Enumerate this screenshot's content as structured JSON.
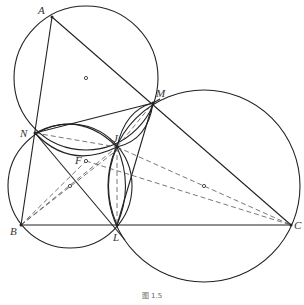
{
  "figure": {
    "caption": "图 1.5",
    "points": [
      {
        "name": "A",
        "x": 52,
        "y": 17,
        "lx": 38,
        "ly": 5
      },
      {
        "name": "M",
        "x": 153,
        "y": 103,
        "lx": 156,
        "ly": 88
      },
      {
        "name": "N",
        "x": 35,
        "y": 133,
        "lx": 20,
        "ly": 128
      },
      {
        "name": "J",
        "x": 117,
        "y": 147,
        "lx": 113,
        "ly": 133
      },
      {
        "name": "F",
        "x": 86,
        "y": 161,
        "lx": 75,
        "ly": 155
      },
      {
        "name": "B",
        "x": 21,
        "y": 225,
        "lx": 10,
        "ly": 226
      },
      {
        "name": "L",
        "x": 117,
        "y": 225,
        "lx": 113,
        "ly": 232
      },
      {
        "name": "C",
        "x": 291,
        "y": 225,
        "lx": 294,
        "ly": 220
      }
    ],
    "circle_centers": [
      {
        "x": 86,
        "y": 78
      },
      {
        "x": 70,
        "y": 186
      },
      {
        "x": 204,
        "y": 186
      }
    ],
    "stroke_color": "#222222",
    "dash_color": "#555555"
  }
}
